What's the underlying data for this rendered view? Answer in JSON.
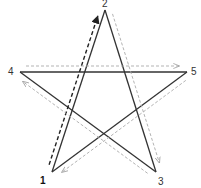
{
  "diagram": {
    "type": "pentagram-stroke-order",
    "vertices": [
      {
        "id": "1",
        "label": "1",
        "x": 52,
        "y": 172,
        "lx": 40,
        "ly": 184,
        "bold": true
      },
      {
        "id": "2",
        "label": "2",
        "x": 105,
        "y": 10,
        "lx": 102,
        "ly": 7,
        "bold": false
      },
      {
        "id": "3",
        "label": "3",
        "x": 156,
        "y": 172,
        "lx": 158,
        "ly": 185,
        "bold": false
      },
      {
        "id": "4",
        "label": "4",
        "x": 20,
        "y": 72,
        "lx": 8,
        "ly": 75,
        "bold": false
      },
      {
        "id": "5",
        "label": "5",
        "x": 187,
        "y": 72,
        "lx": 191,
        "ly": 75,
        "bold": false
      }
    ],
    "edges": [
      {
        "from": "1",
        "to": "2"
      },
      {
        "from": "2",
        "to": "3"
      },
      {
        "from": "3",
        "to": "4"
      },
      {
        "from": "4",
        "to": "5"
      },
      {
        "from": "5",
        "to": "1"
      }
    ],
    "stroke_arrows": [
      {
        "from": "1",
        "to": "2",
        "style": "dashed-dark",
        "color": "#222222"
      },
      {
        "from": "2",
        "to": "3",
        "style": "dashed-light",
        "color": "#aaaaaa"
      },
      {
        "from": "3",
        "to": "4",
        "style": "dashed-light",
        "color": "#aaaaaa"
      },
      {
        "from": "4",
        "to": "5",
        "style": "dashed-light",
        "color": "#aaaaaa"
      },
      {
        "from": "5",
        "to": "1",
        "style": "dashed-light",
        "color": "#aaaaaa"
      }
    ],
    "colors": {
      "star_line": "#333333",
      "arrow_dark": "#222222",
      "arrow_light": "#aaaaaa",
      "background": "#ffffff"
    }
  }
}
